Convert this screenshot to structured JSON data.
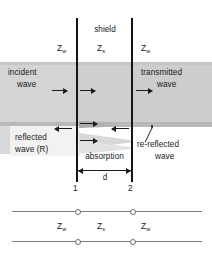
{
  "figure": {
    "title_label": "shield",
    "impedances": {
      "left_symbol": "Z",
      "left_sub": "w",
      "mid_symbol": "Z",
      "mid_sub": "s",
      "right_symbol": "Z",
      "right_sub": "w"
    },
    "regions": {
      "incident_line1": "incident",
      "incident_line2": "wave",
      "transmitted_line1": "transmitted",
      "transmitted_line2": "wave",
      "reflected_line1": "reflected",
      "reflected_line2": "wave (R)",
      "rereflected_line1": "re-reflected",
      "rereflected_line2": "wave",
      "absorption": "absorption"
    },
    "boundaries": {
      "left_number": "1",
      "right_number": "2",
      "thickness_symbol": "d"
    },
    "transmission_line": {
      "left_symbol": "Z",
      "left_sub": "w",
      "mid_symbol": "Z",
      "mid_sub": "s",
      "right_symbol": "Z",
      "right_sub": "w"
    },
    "colors": {
      "field_band": "#d2d2d2",
      "shield_band": "#cfcfcf",
      "wall": "#151515",
      "text": "#1a1a1a",
      "tline": "#7f7f7f"
    }
  }
}
